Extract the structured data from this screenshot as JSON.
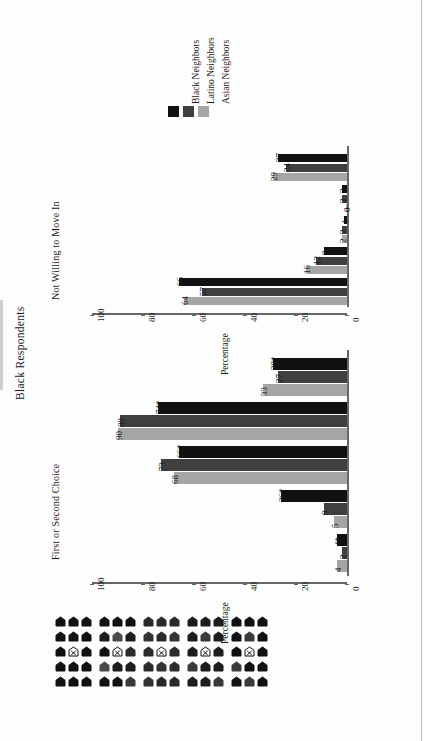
{
  "figure": {
    "main_title": "Black Respondents",
    "panels_order": [
      "first_or_second_choice",
      "not_willing_to_move_in"
    ]
  },
  "legend": {
    "items": [
      {
        "label": "Black Neighbors",
        "color": "#111111"
      },
      {
        "label": "Latino Neighbors",
        "color": "#3f3f3f"
      },
      {
        "label": "Asian Neighbors",
        "color": "#a5a5a5"
      }
    ]
  },
  "axis": {
    "title": "Percentage",
    "ticks": [
      "0",
      "20",
      "40",
      "60",
      "80",
      "100"
    ],
    "min": 0,
    "max": 100
  },
  "chart_data": {
    "type": "bar",
    "title": "Black Respondents",
    "xlabel": "",
    "ylabel": "Percentage",
    "ylim": [
      0,
      100
    ],
    "grid": false,
    "legend_position": "top",
    "orientation": "rotated-90",
    "categories": [
      "Neighborhood 1 (all own-race)",
      "Neighborhood 2",
      "Neighborhood 3",
      "Neighborhood 4",
      "Neighborhood 5 (all other-race)"
    ],
    "panels": [
      {
        "name": "First or Second Choice",
        "series": [
          {
            "name": "Black Neighbors",
            "values": [
              29,
              74,
              66,
              26,
              4
            ],
            "labels": [
              "29*",
              "74*",
              "66*",
              "26*",
              "4*"
            ]
          },
          {
            "name": "Latino Neighbors",
            "values": [
              27,
              89,
              73,
              9,
              2
            ],
            "labels": [
              "27",
              "89",
              "73",
              "9",
              "2"
            ]
          },
          {
            "name": "Asian Neighbors",
            "values": [
              33,
              90,
              68,
              5,
              4
            ],
            "labels": [
              "33",
              "90",
              "68",
              "5",
              "4"
            ]
          }
        ]
      },
      {
        "name": "Not Willing to Move In",
        "series": [
          {
            "name": "Black Neighbors",
            "values": [
              27,
              2,
              1,
              9,
              66
            ],
            "labels": [
              "27",
              "2",
              "1",
              "9",
              "66"
            ]
          },
          {
            "name": "Latino Neighbors",
            "values": [
              24,
              2,
              2,
              12,
              57
            ],
            "labels": [
              "24",
              "2",
              "2",
              "12",
              "57"
            ]
          },
          {
            "name": "Asian Neighbors",
            "values": [
              29,
              0,
              2,
              16,
              64
            ],
            "labels": [
              "29",
              "0",
              "2",
              "16",
              "64"
            ]
          }
        ]
      }
    ]
  },
  "pictograms": {
    "marker_label": "X",
    "rows": 5,
    "cols": 3,
    "groups": [
      {
        "category": "Neighborhood 1",
        "shades": [
          [
            "#111111",
            "#111111",
            "#111111"
          ],
          [
            "#111111",
            "#111111",
            "#111111"
          ],
          [
            "#111111",
            "marker",
            "#111111"
          ],
          [
            "#111111",
            "#111111",
            "#111111"
          ],
          [
            "#111111",
            "#111111",
            "#111111"
          ]
        ]
      },
      {
        "category": "Neighborhood 2",
        "shades": [
          [
            "#111111",
            "#111111",
            "#111111"
          ],
          [
            "#1d1d1d",
            "#4a4a4a",
            "#1d1d1d"
          ],
          [
            "#111111",
            "marker",
            "#2a2a2a"
          ],
          [
            "#4a4a4a",
            "#1d1d1d",
            "#1d1d1d"
          ],
          [
            "#111111",
            "#111111",
            "#3a3a3a"
          ]
        ]
      },
      {
        "category": "Neighborhood 3",
        "shades": [
          [
            "#2a2a2a",
            "#2a2a2a",
            "#2a2a2a"
          ],
          [
            "#333333",
            "#2a2a2a",
            "#333333"
          ],
          [
            "#2a2a2a",
            "marker",
            "#2a2a2a"
          ],
          [
            "#2a2a2a",
            "#333333",
            "#2a2a2a"
          ],
          [
            "#333333",
            "#2a2a2a",
            "#2a2a2a"
          ]
        ]
      },
      {
        "category": "Neighborhood 4",
        "shades": [
          [
            "#1d1d1d",
            "#1d1d1d",
            "#1d1d1d"
          ],
          [
            "#1d1d1d",
            "#3a3a3a",
            "#1d1d1d"
          ],
          [
            "#1d1d1d",
            "marker",
            "#1d1d1d"
          ],
          [
            "#3a3a3a",
            "#1d1d1d",
            "#1d1d1d"
          ],
          [
            "#1d1d1d",
            "#1d1d1d",
            "#3a3a3a"
          ]
        ]
      },
      {
        "category": "Neighborhood 5",
        "shades": [
          [
            "#111111",
            "#111111",
            "#111111"
          ],
          [
            "#111111",
            "#3a3a3a",
            "#111111"
          ],
          [
            "#111111",
            "marker",
            "#111111"
          ],
          [
            "#3a3a3a",
            "#111111",
            "#111111"
          ],
          [
            "#111111",
            "#3a3a3a",
            "#111111"
          ]
        ]
      }
    ]
  }
}
